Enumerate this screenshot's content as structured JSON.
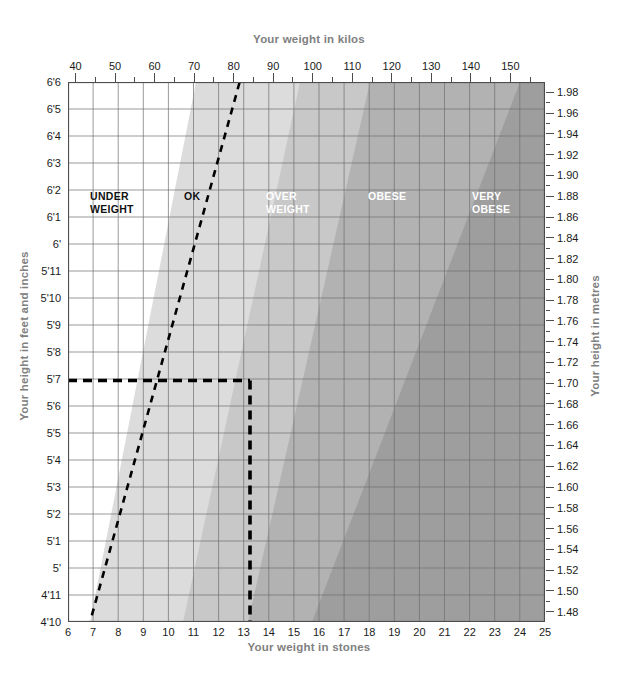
{
  "titles": {
    "top": "Your weight in kilos",
    "bottom": "Your weight in stones",
    "left": "Your height in feet and inches",
    "right": "Your height in metres"
  },
  "chart_data": {
    "type": "area",
    "title": "Your weight in kilos",
    "xlabel": "Your weight in stones",
    "ylabel": "Your height in feet and inches",
    "grid": true,
    "legend": "in-plot band labels",
    "x_axis_bottom": {
      "label": "Your weight in stones",
      "unit": "stones",
      "range": [
        6,
        25
      ],
      "ticks": [
        6,
        7,
        8,
        9,
        10,
        11,
        12,
        13,
        14,
        15,
        16,
        17,
        18,
        19,
        20,
        21,
        22,
        23,
        24,
        25
      ],
      "tick_labels": [
        "6",
        "7",
        "8",
        "9",
        "10",
        "11",
        "12",
        "13",
        "14",
        "15",
        "16",
        "17",
        "18",
        "19",
        "20",
        "21",
        "22",
        "23",
        "24",
        "25"
      ]
    },
    "x_axis_top": {
      "label": "Your weight in kilos",
      "unit": "kg",
      "range": [
        38.1,
        158.8
      ],
      "ticks": [
        40,
        50,
        60,
        70,
        80,
        90,
        100,
        110,
        120,
        130,
        140,
        150
      ],
      "tick_labels": [
        "40",
        "50",
        "60",
        "70",
        "80",
        "90",
        "100",
        "110",
        "120",
        "130",
        "140",
        "150"
      ]
    },
    "y_axis_left": {
      "label": "Your height in feet and inches",
      "unit": "ft-in",
      "range": [
        "4'10",
        "6'6"
      ],
      "ticks": [
        "4'10",
        "4'11",
        "5'",
        "5'1",
        "5'2",
        "5'3",
        "5'4",
        "5'5",
        "5'6",
        "5'7",
        "5'8",
        "5'9",
        "5'10",
        "5'11",
        "6'",
        "6'1",
        "6'2",
        "6'3",
        "6'4",
        "6'5",
        "6'6"
      ]
    },
    "y_axis_right": {
      "label": "Your height in metres",
      "unit": "m",
      "range": [
        1.47,
        1.99
      ],
      "ticks": [
        1.48,
        1.5,
        1.52,
        1.54,
        1.56,
        1.58,
        1.6,
        1.62,
        1.64,
        1.66,
        1.68,
        1.7,
        1.72,
        1.74,
        1.76,
        1.78,
        1.8,
        1.82,
        1.84,
        1.86,
        1.88,
        1.9,
        1.92,
        1.94,
        1.96,
        1.98
      ],
      "tick_labels": [
        "1.48",
        "1.50",
        "1.52",
        "1.54",
        "1.56",
        "1.58",
        "1.60",
        "1.62",
        "1.64",
        "1.66",
        "1.68",
        "1.70",
        "1.72",
        "1.74",
        "1.76",
        "1.78",
        "1.80",
        "1.82",
        "1.84",
        "1.86",
        "1.88",
        "1.90",
        "1.92",
        "1.94",
        "1.96",
        "1.98"
      ]
    },
    "bands": [
      {
        "name": "UNDER WEIGHT",
        "label": "UNDER\nWEIGHT",
        "bmi_max": 18.5,
        "color": "#ffffff",
        "text_color": "#111111"
      },
      {
        "name": "OK",
        "label": "OK",
        "bmi_range": [
          18.5,
          25
        ],
        "color": "#dcdcdc",
        "text_color": "#111111"
      },
      {
        "name": "OVER WEIGHT",
        "label": "OVER\nWEIGHT",
        "bmi_range": [
          25,
          30
        ],
        "color": "#c0c0c0",
        "text_color": "#ffffff"
      },
      {
        "name": "OBESE",
        "label": "OBESE",
        "bmi_range": [
          30,
          35
        ],
        "color": "#a8a8a8",
        "text_color": "#ffffff"
      },
      {
        "name": "VERY OBESE",
        "label": "VERY\nOBESE",
        "bmi_min": 35,
        "color": "#949494",
        "text_color": "#ffffff"
      }
    ],
    "indicator": {
      "height_ft_in": "5'7",
      "height_m": 1.7,
      "weight_stones": 13,
      "weight_kg": 82.6,
      "style": "dashed",
      "color": "#000000",
      "description": "dashed guide lines from 5'7 height across to 13 stones weight"
    },
    "boundary_line": {
      "name": "underweight-ok-boundary",
      "style": "dashed",
      "color": "#000000",
      "bmi": 18.5
    }
  }
}
